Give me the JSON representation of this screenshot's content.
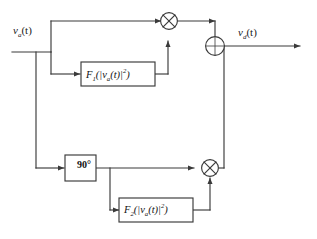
{
  "diagram": {
    "stroke_color": "#3a3a3a",
    "box_fill": "#ffffff",
    "background": "#ffffff",
    "signals": {
      "input_label": "v",
      "input_sub": "a",
      "input_arg": "(t)",
      "output_label": "v",
      "output_sub": "d",
      "output_arg": "(t)"
    },
    "blocks": [
      {
        "id": "f1",
        "name": "F",
        "sub": "1",
        "arg_open": "(|v",
        "arg_sub": "a",
        "arg_t": "(t)|",
        "arg_pow": "2",
        "arg_close": ")",
        "full_text": "F1(|va(t)|2)"
      },
      {
        "id": "f2",
        "name": "F",
        "sub": "2",
        "arg_open": "(|v",
        "arg_sub": "a",
        "arg_t": "(t)|",
        "arg_pow": "2",
        "arg_close": ")",
        "full_text": "F2(|va(t)|2)"
      },
      {
        "id": "phase",
        "label": "90°"
      }
    ],
    "operators": [
      {
        "id": "mult-upper",
        "symbol": "×",
        "kind": "multiplier"
      },
      {
        "id": "mult-lower",
        "symbol": "×",
        "kind": "multiplier"
      },
      {
        "id": "summer",
        "symbol": "+",
        "kind": "summing-junction"
      }
    ]
  }
}
